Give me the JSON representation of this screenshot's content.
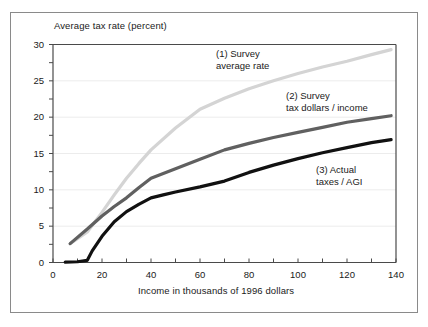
{
  "chart_data": {
    "type": "line",
    "title": "",
    "xlabel": "Income in thousands of 1996 dollars",
    "ylabel": "Average tax rate (percent)",
    "xlim": [
      0,
      140
    ],
    "ylim": [
      0,
      30
    ],
    "x_ticks": [
      0,
      20,
      40,
      60,
      80,
      100,
      120,
      140
    ],
    "x_minor_ticks": [
      10,
      30,
      50,
      70,
      90,
      110,
      130
    ],
    "y_ticks": [
      0,
      5,
      10,
      15,
      20,
      25,
      30
    ],
    "y_minor_ticks": [
      2.5,
      7.5,
      12.5,
      17.5,
      22.5,
      27.5
    ],
    "grid": "horizontal",
    "legend_position": "inline-annotations",
    "series": [
      {
        "name": "(1) Survey average rate",
        "color": "#d4d4d4",
        "x": [
          7,
          14,
          20,
          25,
          30,
          35,
          40,
          50,
          60,
          70,
          80,
          90,
          100,
          110,
          120,
          130,
          138
        ],
        "values": [
          2.6,
          4.2,
          6.9,
          9.3,
          11.6,
          13.6,
          15.5,
          18.5,
          21.1,
          22.6,
          23.9,
          25.0,
          26.0,
          26.9,
          27.7,
          28.6,
          29.3
        ]
      },
      {
        "name": "(2) Survey tax dollars / income",
        "color": "#606060",
        "x": [
          7,
          14,
          20,
          25,
          30,
          35,
          40,
          50,
          60,
          70,
          80,
          90,
          100,
          110,
          120,
          130,
          138
        ],
        "values": [
          2.6,
          4.6,
          6.4,
          7.7,
          8.9,
          10.3,
          11.6,
          12.9,
          14.2,
          15.5,
          16.4,
          17.2,
          17.9,
          18.6,
          19.3,
          19.8,
          20.2
        ]
      },
      {
        "name": "(3) Actual taxes / AGI",
        "color": "#111111",
        "x": [
          5,
          10,
          14,
          16,
          20,
          25,
          30,
          35,
          40,
          45,
          50,
          60,
          70,
          80,
          90,
          100,
          110,
          120,
          130,
          138
        ],
        "values": [
          0.05,
          0.1,
          0.3,
          1.6,
          3.6,
          5.6,
          7.0,
          8.0,
          8.9,
          9.3,
          9.7,
          10.4,
          11.2,
          12.4,
          13.4,
          14.3,
          15.1,
          15.8,
          16.5,
          16.9
        ]
      }
    ],
    "annotations": [
      {
        "id": "annotation-1",
        "line1": "(1) Survey",
        "line2": "average rate"
      },
      {
        "id": "annotation-2",
        "line1": "(2) Survey",
        "line2": "tax dollars / income"
      },
      {
        "id": "annotation-3",
        "line1": "(3) Actual",
        "line2": "taxes / AGI"
      }
    ]
  },
  "axis": {
    "y_title": "Average tax rate (percent)",
    "x_title": "Income in thousands of 1996 dollars",
    "y_labels": [
      "30",
      "25",
      "20",
      "15",
      "10",
      "5",
      "0"
    ],
    "x_labels": [
      "0",
      "20",
      "40",
      "60",
      "80",
      "100",
      "120",
      "140"
    ]
  },
  "colors": {
    "series_1": "#d4d4d4",
    "series_2": "#606060",
    "series_3": "#111111",
    "axis": "#4a4a4a",
    "grid": "#ececec",
    "frame": "#8a8a8a",
    "text": "#1a1a1a",
    "background": "#ffffff"
  }
}
